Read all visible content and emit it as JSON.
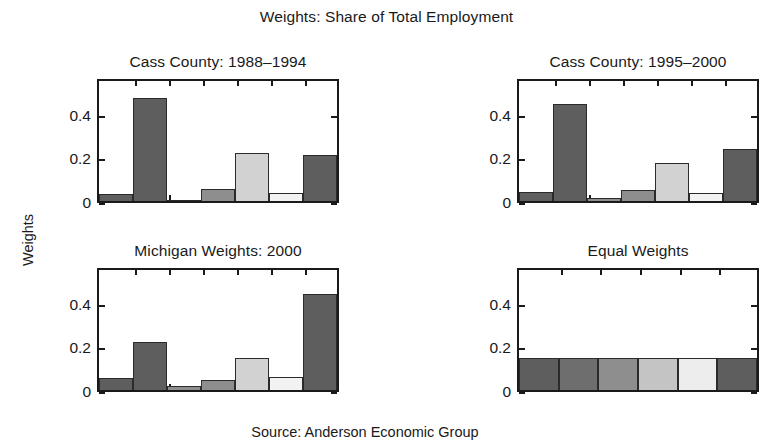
{
  "figure": {
    "main_title": "Weights: Share of Total Employment",
    "y_axis_group_label": "Weights",
    "source_note": "Source: Anderson Economic Group"
  },
  "chart_data": {
    "type": "bar",
    "title": "Weights: Share of Total Employment",
    "xlabel": "",
    "ylabel": "Weights",
    "ylim": [
      0,
      0.55
    ],
    "yticks": [
      0,
      0.2,
      0.4
    ],
    "ytick_labels": [
      "0",
      "0.2",
      "0.4"
    ],
    "grid": false,
    "legend": "none",
    "layout": "2x2 subplot grid",
    "n_categories": 6,
    "bar_colors": [
      "#5e5e5e",
      "#6b6b6b",
      "#8e8e8e",
      "#c9c9c9",
      "#ececec",
      "#5e5e5e"
    ],
    "panels": [
      {
        "title": "Cass County: 1988–1994",
        "values": [
          0.03,
          0.47,
          0.005,
          0.055,
          0.22,
          0.035,
          0.21
        ]
      },
      {
        "title": "Cass County: 1995–2000",
        "values": [
          0.04,
          0.445,
          0.015,
          0.05,
          0.175,
          0.035,
          0.24
        ]
      },
      {
        "title": "Michigan Weights: 2000",
        "values": [
          0.055,
          0.22,
          0.02,
          0.045,
          0.145,
          0.06,
          0.44
        ]
      },
      {
        "title": "Equal Weights",
        "values": [
          0.145,
          0.145,
          0.145,
          0.145,
          0.145,
          0.145
        ]
      }
    ]
  },
  "panels": [
    {
      "id": "cass-1988-1994",
      "title": "Cass County: 1988–1994",
      "ytick_labels": [
        "0",
        "0.2",
        "0.4"
      ],
      "bars": [
        {
          "value": 0.03,
          "color": "#5e5e5e"
        },
        {
          "value": 0.47,
          "color": "#5e5e5e"
        },
        {
          "value": 0.005,
          "color": "#8e8e8e"
        },
        {
          "value": 0.055,
          "color": "#8e8e8e"
        },
        {
          "value": 0.22,
          "color": "#d2d2d2"
        },
        {
          "value": 0.035,
          "color": "#f2f2f2"
        },
        {
          "value": 0.21,
          "color": "#5e5e5e"
        }
      ]
    },
    {
      "id": "cass-1995-2000",
      "title": "Cass County: 1995–2000",
      "ytick_labels": [
        "0",
        "0.2",
        "0.4"
      ],
      "bars": [
        {
          "value": 0.04,
          "color": "#5e5e5e"
        },
        {
          "value": 0.445,
          "color": "#5e5e5e"
        },
        {
          "value": 0.015,
          "color": "#8e8e8e"
        },
        {
          "value": 0.05,
          "color": "#8e8e8e"
        },
        {
          "value": 0.175,
          "color": "#d2d2d2"
        },
        {
          "value": 0.035,
          "color": "#f2f2f2"
        },
        {
          "value": 0.24,
          "color": "#5e5e5e"
        }
      ]
    },
    {
      "id": "michigan-2000",
      "title": "Michigan Weights: 2000",
      "ytick_labels": [
        "0",
        "0.2",
        "0.4"
      ],
      "bars": [
        {
          "value": 0.055,
          "color": "#5e5e5e"
        },
        {
          "value": 0.22,
          "color": "#5e5e5e"
        },
        {
          "value": 0.02,
          "color": "#8e8e8e"
        },
        {
          "value": 0.045,
          "color": "#8e8e8e"
        },
        {
          "value": 0.145,
          "color": "#d2d2d2"
        },
        {
          "value": 0.06,
          "color": "#f2f2f2"
        },
        {
          "value": 0.44,
          "color": "#5e5e5e"
        }
      ]
    },
    {
      "id": "equal-weights",
      "title": "Equal Weights",
      "ytick_labels": [
        "0",
        "0.2",
        "0.4"
      ],
      "bars": [
        {
          "value": 0.145,
          "color": "#5e5e5e"
        },
        {
          "value": 0.145,
          "color": "#6e6e6e"
        },
        {
          "value": 0.145,
          "color": "#8e8e8e"
        },
        {
          "value": 0.145,
          "color": "#c4c4c4"
        },
        {
          "value": 0.145,
          "color": "#ededed"
        },
        {
          "value": 0.145,
          "color": "#5e5e5e"
        }
      ]
    }
  ]
}
